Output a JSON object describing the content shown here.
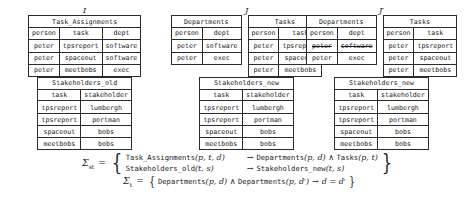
{
  "groups": [
    {
      "label": "I",
      "top_tables": [
        {
          "name": "Task_Assignments",
          "columns": [
            "person",
            "task",
            "dept"
          ],
          "rows": [
            [
              "peter",
              "tpsreport",
              "software"
            ],
            [
              "peter",
              "spaceout",
              "software"
            ],
            [
              "peter",
              "meetbobs",
              "exec"
            ]
          ]
        }
      ],
      "bottom_table": {
        "name": "Stakeholders_old",
        "columns": [
          "task",
          "stakeholder"
        ],
        "rows": [
          [
            "tpsreport",
            "lumbergh"
          ],
          [
            "tpsreport",
            "portman"
          ],
          [
            "spaceout",
            "bobs"
          ],
          [
            "meetbobs",
            "bobs"
          ]
        ]
      }
    },
    {
      "label": "J",
      "top_tables": [
        {
          "name": "Departments",
          "columns": [
            "person",
            "dept"
          ],
          "rows": [
            [
              "peter",
              "software"
            ],
            [
              "peter",
              "exec"
            ]
          ]
        },
        {
          "name": "Tasks",
          "columns": [
            "person",
            "task"
          ],
          "rows": [
            [
              "peter",
              "tpsreport"
            ],
            [
              "peter",
              "spaceout"
            ],
            [
              "peter",
              "meetbobs"
            ]
          ]
        }
      ],
      "bottom_table": {
        "name": "Stakeholders_new",
        "columns": [
          "task",
          "stakeholder"
        ],
        "rows": [
          [
            "tpsreport",
            "lumbergh"
          ],
          [
            "tpsreport",
            "portman"
          ],
          [
            "spaceout",
            "bobs"
          ],
          [
            "meetbobs",
            "bobs"
          ]
        ]
      }
    },
    {
      "label": "J′",
      "top_tables": [
        {
          "name": "Departments",
          "columns": [
            "person",
            "dept"
          ],
          "rows": [
            [
              "peter",
              "software"
            ],
            [
              "peter",
              "exec"
            ]
          ],
          "struck_rows": [
            0
          ]
        },
        {
          "name": "Tasks",
          "columns": [
            "person",
            "task"
          ],
          "rows": [
            [
              "peter",
              "tpsreport"
            ],
            [
              "peter",
              "spaceout"
            ],
            [
              "peter",
              "meetbobs"
            ]
          ]
        }
      ],
      "bottom_table": {
        "name": "Stakeholders_new",
        "columns": [
          "task",
          "stakeholder"
        ],
        "rows": [
          [
            "tpsreport",
            "lumbergh"
          ],
          [
            "tpsreport",
            "portman"
          ],
          [
            "spaceout",
            "bobs"
          ],
          [
            "meetbobs",
            "bobs"
          ]
        ]
      }
    }
  ],
  "formulas": {
    "st": {
      "symbol": "Σ",
      "subscript": "st",
      "equals": "=",
      "dependencies": [
        {
          "lhs_rel": "Task_Assignments",
          "lhs_args": "(p, t, d)",
          "arrow": "→",
          "rhs": [
            {
              "rel": "Departments",
              "args": "(p, d)"
            },
            {
              "connector": "∧",
              "rel": "Tasks",
              "args": "(p, t)"
            }
          ]
        },
        {
          "lhs_rel": "Stakeholders_old",
          "lhs_args": "(t, s)",
          "arrow": "→",
          "rhs": [
            {
              "rel": "Stakeholders_new",
              "args": "(t, s)"
            }
          ]
        }
      ]
    },
    "t": {
      "symbol": "Σ",
      "subscript": "t",
      "equals": "=",
      "dependencies": [
        {
          "lhs_rel": "Departments",
          "lhs_args": "(p, d)",
          "connector": "∧",
          "lhs_rel2": "Departments",
          "lhs_args2": "(p, d′)",
          "arrow": "→",
          "rhs_eq": "d = d′"
        }
      ]
    }
  }
}
